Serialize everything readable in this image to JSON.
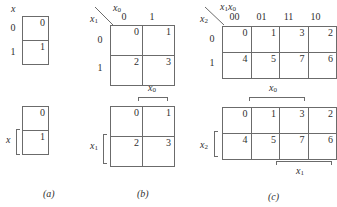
{
  "figure": {
    "caption_a": "(a)",
    "caption_b": "(b)",
    "caption_c": "(c)"
  },
  "maps": {
    "one_variable_indexed": {
      "var_top": "x",
      "row_headers": [
        "0",
        "1"
      ],
      "cells": [
        [
          "0"
        ],
        [
          "1"
        ]
      ]
    },
    "one_variable_bracketed": {
      "bracket_left": "x",
      "cells": [
        [
          "0"
        ],
        [
          "1"
        ]
      ]
    },
    "two_variable_indexed": {
      "var_top": "x",
      "var_top_sub": "0",
      "var_side": "x",
      "var_side_sub": "1",
      "col_headers": [
        "0",
        "1"
      ],
      "row_headers": [
        "0",
        "1"
      ],
      "cells": [
        [
          "0",
          "1"
        ],
        [
          "2",
          "3"
        ]
      ]
    },
    "two_variable_bracketed": {
      "bracket_top": "x",
      "bracket_top_sub": "0",
      "bracket_left": "x",
      "bracket_left_sub": "1",
      "cells": [
        [
          "0",
          "1"
        ],
        [
          "2",
          "3"
        ]
      ]
    },
    "three_variable_indexed": {
      "var_top": "x",
      "var_top_sub1": "1",
      "var_top_sub2": "0",
      "var_side": "x",
      "var_side_sub": "2",
      "col_headers": [
        "00",
        "01",
        "11",
        "10"
      ],
      "row_headers": [
        "0",
        "1"
      ],
      "cells": [
        [
          "0",
          "1",
          "3",
          "2"
        ],
        [
          "4",
          "5",
          "7",
          "6"
        ]
      ]
    },
    "three_variable_bracketed": {
      "bracket_top": "x",
      "bracket_top_sub": "0",
      "bracket_bottom": "x",
      "bracket_bottom_sub": "1",
      "bracket_left": "x",
      "bracket_left_sub": "2",
      "cells": [
        [
          "0",
          "1",
          "3",
          "2"
        ],
        [
          "4",
          "5",
          "7",
          "6"
        ]
      ]
    }
  },
  "colors": {
    "stroke": "#6b6b6b",
    "text": "#2f2f2f",
    "background": "#ffffff"
  }
}
